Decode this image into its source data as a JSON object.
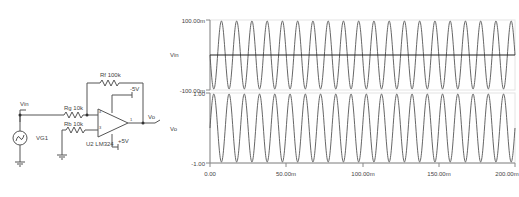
{
  "schematic": {
    "labels": {
      "vin_probe": "Vin",
      "source": "VG1",
      "rg": "Rg 10k",
      "rb": "Rb 10k",
      "rf": "Rf 100k",
      "opamp": "U2 LM324",
      "neg_supply": "-5V",
      "pos_supply": "+5V",
      "vo_probe": "Vo",
      "pin_inv": "4",
      "pin_noninv": "3",
      "pin_out": "1"
    }
  },
  "chart_data": [
    {
      "type": "line",
      "title": "",
      "ylabel": "Vin",
      "xlabel": "",
      "ylim": [
        -0.1,
        0.1
      ],
      "ytick_labels": [
        "100.00m",
        "-100.00m"
      ],
      "xlim": [
        0,
        0.2
      ],
      "series": [
        {
          "name": "Vin",
          "waveform": "sine",
          "amplitude": 0.1,
          "frequency_hz": 100,
          "cycles": 20
        },
        {
          "name": "zero-line",
          "values": [
            0,
            0
          ]
        }
      ],
      "grid": false
    },
    {
      "type": "line",
      "title": "",
      "ylabel": "Vo",
      "xlabel": "",
      "ylim": [
        -1.0,
        1.0
      ],
      "ytick_labels": [
        "1.00",
        "-1.00"
      ],
      "xlim": [
        0,
        0.2
      ],
      "xtick_labels": [
        "0.00",
        "50.00m",
        "100.00m",
        "150.00m",
        "200.00m"
      ],
      "series": [
        {
          "name": "Vo",
          "waveform": "sine",
          "amplitude": 1.0,
          "frequency_hz": 100,
          "cycles": 20,
          "phase": "inverted"
        }
      ],
      "grid": false
    }
  ],
  "colors": {
    "trace": "#555555",
    "axis": "#888888",
    "text": "#444444",
    "zero_line": "#222222"
  }
}
